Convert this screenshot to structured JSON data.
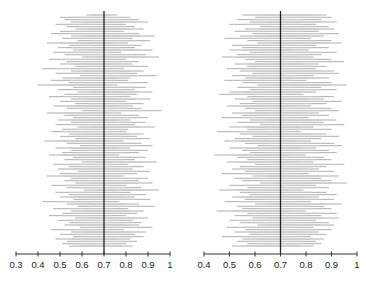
{
  "chart_data": [
    {
      "type": "interval",
      "title": "",
      "xlabel": "",
      "ylabel": "",
      "xlim": [
        0.3,
        1.0
      ],
      "xticks": [
        "0.3",
        "0.4",
        "0.5",
        "0.6",
        "0.7",
        "0.8",
        "0.9",
        "1"
      ],
      "reference_line": 0.7,
      "n_intervals": 100,
      "grid": false,
      "intervals": [
        [
          0.62,
          0.76
        ],
        [
          0.5,
          0.82
        ],
        [
          0.52,
          0.86
        ],
        [
          0.55,
          0.9
        ],
        [
          0.48,
          0.8
        ],
        [
          0.53,
          0.84
        ],
        [
          0.57,
          0.88
        ],
        [
          0.5,
          0.79
        ],
        [
          0.46,
          0.86
        ],
        [
          0.55,
          0.93
        ],
        [
          0.51,
          0.83
        ],
        [
          0.58,
          0.91
        ],
        [
          0.44,
          0.81
        ],
        [
          0.54,
          0.87
        ],
        [
          0.49,
          0.84
        ],
        [
          0.56,
          0.92
        ],
        [
          0.47,
          0.78
        ],
        [
          0.52,
          0.89
        ],
        [
          0.6,
          0.95
        ],
        [
          0.45,
          0.8
        ],
        [
          0.53,
          0.86
        ],
        [
          0.5,
          0.83
        ],
        [
          0.57,
          0.9
        ],
        [
          0.42,
          0.79
        ],
        [
          0.55,
          0.88
        ],
        [
          0.48,
          0.85
        ],
        [
          0.59,
          0.94
        ],
        [
          0.51,
          0.82
        ],
        [
          0.46,
          0.81
        ],
        [
          0.54,
          0.9
        ],
        [
          0.4,
          0.76
        ],
        [
          0.56,
          0.89
        ],
        [
          0.49,
          0.84
        ],
        [
          0.58,
          0.92
        ],
        [
          0.52,
          0.85
        ],
        [
          0.45,
          0.82
        ],
        [
          0.55,
          0.91
        ],
        [
          0.5,
          0.8
        ],
        [
          0.57,
          0.88
        ],
        [
          0.47,
          0.83
        ],
        [
          0.53,
          0.87
        ],
        [
          0.6,
          0.96
        ],
        [
          0.44,
          0.78
        ],
        [
          0.52,
          0.86
        ],
        [
          0.56,
          0.9
        ],
        [
          0.49,
          0.82
        ],
        [
          0.55,
          0.89
        ],
        [
          0.48,
          0.84
        ],
        [
          0.58,
          0.93
        ],
        [
          0.51,
          0.81
        ],
        [
          0.46,
          0.8
        ],
        [
          0.54,
          0.88
        ],
        [
          0.5,
          0.85
        ],
        [
          0.57,
          0.91
        ],
        [
          0.43,
          0.79
        ],
        [
          0.53,
          0.87
        ],
        [
          0.59,
          0.92
        ],
        [
          0.48,
          0.82
        ],
        [
          0.55,
          0.9
        ],
        [
          0.51,
          0.86
        ],
        [
          0.45,
          0.77
        ],
        [
          0.56,
          0.89
        ],
        [
          0.52,
          0.84
        ],
        [
          0.6,
          0.94
        ],
        [
          0.47,
          0.81
        ],
        [
          0.54,
          0.88
        ],
        [
          0.49,
          0.83
        ],
        [
          0.58,
          0.91
        ],
        [
          0.5,
          0.85
        ],
        [
          0.44,
          0.79
        ],
        [
          0.55,
          0.9
        ],
        [
          0.52,
          0.86
        ],
        [
          0.57,
          0.92
        ],
        [
          0.46,
          0.8
        ],
        [
          0.53,
          0.87
        ],
        [
          0.61,
          0.95
        ],
        [
          0.48,
          0.82
        ],
        [
          0.54,
          0.89
        ],
        [
          0.5,
          0.84
        ],
        [
          0.56,
          0.91
        ],
        [
          0.42,
          0.77
        ],
        [
          0.53,
          0.86
        ],
        [
          0.58,
          0.93
        ],
        [
          0.47,
          0.81
        ],
        [
          0.55,
          0.88
        ],
        [
          0.51,
          0.85
        ],
        [
          0.45,
          0.8
        ],
        [
          0.57,
          0.9
        ],
        [
          0.49,
          0.83
        ],
        [
          0.54,
          0.87
        ],
        [
          0.52,
          0.86
        ],
        [
          0.59,
          0.92
        ],
        [
          0.46,
          0.79
        ],
        [
          0.55,
          0.89
        ],
        [
          0.5,
          0.84
        ],
        [
          0.56,
          0.88
        ],
        [
          0.48,
          0.82
        ],
        [
          0.53,
          0.85
        ],
        [
          0.51,
          0.8
        ],
        [
          0.54,
          0.83
        ]
      ]
    },
    {
      "type": "interval",
      "title": "",
      "xlabel": "",
      "ylabel": "",
      "xlim": [
        0.4,
        1.0
      ],
      "xticks": [
        "0.4",
        "0.5",
        "0.6",
        "0.7",
        "0.8",
        "0.9",
        "1"
      ],
      "reference_line": 0.7,
      "n_intervals": 100,
      "grid": false,
      "intervals": [
        [
          0.55,
          0.88
        ],
        [
          0.6,
          0.9
        ],
        [
          0.53,
          0.86
        ],
        [
          0.58,
          0.92
        ],
        [
          0.5,
          0.84
        ],
        [
          0.62,
          0.89
        ],
        [
          0.56,
          0.91
        ],
        [
          0.52,
          0.85
        ],
        [
          0.59,
          0.93
        ],
        [
          0.54,
          0.87
        ],
        [
          0.48,
          0.82
        ],
        [
          0.57,
          0.9
        ],
        [
          0.61,
          0.94
        ],
        [
          0.51,
          0.84
        ],
        [
          0.55,
          0.89
        ],
        [
          0.5,
          0.81
        ],
        [
          0.58,
          0.92
        ],
        [
          0.53,
          0.86
        ],
        [
          0.47,
          0.83
        ],
        [
          0.56,
          0.9
        ],
        [
          0.6,
          0.95
        ],
        [
          0.52,
          0.85
        ],
        [
          0.57,
          0.88
        ],
        [
          0.49,
          0.84
        ],
        [
          0.54,
          0.91
        ],
        [
          0.59,
          0.93
        ],
        [
          0.51,
          0.83
        ],
        [
          0.56,
          0.89
        ],
        [
          0.48,
          0.8
        ],
        [
          0.55,
          0.9
        ],
        [
          0.61,
          0.96
        ],
        [
          0.53,
          0.86
        ],
        [
          0.58,
          0.92
        ],
        [
          0.5,
          0.84
        ],
        [
          0.46,
          0.79
        ],
        [
          0.57,
          0.91
        ],
        [
          0.52,
          0.87
        ],
        [
          0.59,
          0.94
        ],
        [
          0.54,
          0.88
        ],
        [
          0.49,
          0.82
        ],
        [
          0.56,
          0.9
        ],
        [
          0.6,
          0.93
        ],
        [
          0.51,
          0.85
        ],
        [
          0.55,
          0.89
        ],
        [
          0.47,
          0.81
        ],
        [
          0.58,
          0.92
        ],
        [
          0.53,
          0.87
        ],
        [
          0.62,
          0.95
        ],
        [
          0.5,
          0.83
        ],
        [
          0.57,
          0.9
        ],
        [
          0.45,
          0.78
        ],
        [
          0.54,
          0.88
        ],
        [
          0.59,
          0.93
        ],
        [
          0.52,
          0.86
        ],
        [
          0.48,
          0.82
        ],
        [
          0.56,
          0.91
        ],
        [
          0.61,
          0.94
        ],
        [
          0.5,
          0.84
        ],
        [
          0.55,
          0.89
        ],
        [
          0.58,
          0.92
        ],
        [
          0.44,
          0.8
        ],
        [
          0.53,
          0.87
        ],
        [
          0.57,
          0.9
        ],
        [
          0.49,
          0.83
        ],
        [
          0.6,
          0.95
        ],
        [
          0.54,
          0.88
        ],
        [
          0.51,
          0.85
        ],
        [
          0.56,
          0.91
        ],
        [
          0.47,
          0.81
        ],
        [
          0.59,
          0.93
        ],
        [
          0.52,
          0.86
        ],
        [
          0.55,
          0.9
        ],
        [
          0.62,
          0.96
        ],
        [
          0.5,
          0.84
        ],
        [
          0.57,
          0.89
        ],
        [
          0.46,
          0.79
        ],
        [
          0.54,
          0.88
        ],
        [
          0.58,
          0.92
        ],
        [
          0.51,
          0.85
        ],
        [
          0.56,
          0.91
        ],
        [
          0.48,
          0.82
        ],
        [
          0.6,
          0.94
        ],
        [
          0.53,
          0.87
        ],
        [
          0.55,
          0.9
        ],
        [
          0.45,
          0.8
        ],
        [
          0.57,
          0.92
        ],
        [
          0.52,
          0.86
        ],
        [
          0.59,
          0.93
        ],
        [
          0.5,
          0.84
        ],
        [
          0.54,
          0.89
        ],
        [
          0.61,
          0.91
        ],
        [
          0.49,
          0.83
        ],
        [
          0.56,
          0.9
        ],
        [
          0.52,
          0.85
        ],
        [
          0.58,
          0.88
        ],
        [
          0.47,
          0.82
        ],
        [
          0.55,
          0.87
        ],
        [
          0.53,
          0.84
        ],
        [
          0.57,
          0.86
        ],
        [
          0.51,
          0.83
        ]
      ]
    }
  ]
}
